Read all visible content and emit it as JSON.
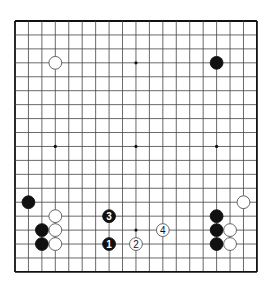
{
  "diagram": {
    "type": "go-board",
    "size": 19,
    "origin": {
      "x": 15,
      "y": 21
    },
    "spacing": {
      "x": 13.44,
      "y": 13.94
    },
    "colors": {
      "background": "#ffffff",
      "line": "#444444",
      "border": "#111111",
      "black": "#111111",
      "white": "#ffffff"
    },
    "star_points": [
      [
        3,
        3
      ],
      [
        9,
        3
      ],
      [
        15,
        3
      ],
      [
        3,
        9
      ],
      [
        9,
        9
      ],
      [
        15,
        9
      ],
      [
        3,
        15
      ],
      [
        9,
        15
      ],
      [
        15,
        15
      ]
    ],
    "stones": [
      {
        "color": "white",
        "col": 3,
        "row": 3,
        "label": ""
      },
      {
        "color": "black",
        "col": 15,
        "row": 3,
        "label": ""
      },
      {
        "color": "black",
        "col": 1,
        "row": 13,
        "label": ""
      },
      {
        "color": "white",
        "col": 17,
        "row": 13,
        "label": ""
      },
      {
        "color": "white",
        "col": 3,
        "row": 14,
        "label": ""
      },
      {
        "color": "black",
        "col": 7,
        "row": 14,
        "label": "3"
      },
      {
        "color": "black",
        "col": 15,
        "row": 14,
        "label": ""
      },
      {
        "color": "black",
        "col": 2,
        "row": 15,
        "label": ""
      },
      {
        "color": "white",
        "col": 3,
        "row": 15,
        "label": ""
      },
      {
        "color": "white",
        "col": 11,
        "row": 15,
        "label": "4"
      },
      {
        "color": "black",
        "col": 15,
        "row": 15,
        "label": ""
      },
      {
        "color": "white",
        "col": 16,
        "row": 15,
        "label": ""
      },
      {
        "color": "black",
        "col": 2,
        "row": 16,
        "label": ""
      },
      {
        "color": "white",
        "col": 3,
        "row": 16,
        "label": ""
      },
      {
        "color": "black",
        "col": 7,
        "row": 16,
        "label": "1"
      },
      {
        "color": "white",
        "col": 9,
        "row": 16,
        "label": "2"
      },
      {
        "color": "black",
        "col": 15,
        "row": 16,
        "label": ""
      },
      {
        "color": "white",
        "col": 16,
        "row": 16,
        "label": ""
      }
    ]
  }
}
